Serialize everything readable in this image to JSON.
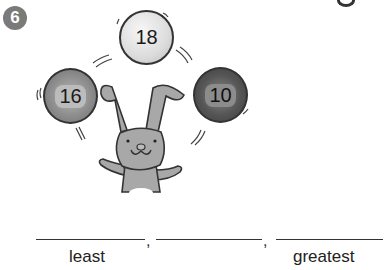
{
  "problem": {
    "number": "6",
    "balls": [
      {
        "value": "18",
        "shade": "light"
      },
      {
        "value": "16",
        "shade": "medium"
      },
      {
        "value": "10",
        "shade": "dark"
      }
    ],
    "answer_blanks": [
      {
        "label": "least",
        "value": ""
      },
      {
        "label": "",
        "value": ""
      },
      {
        "label": "greatest",
        "value": ""
      }
    ],
    "separator": ","
  },
  "colors": {
    "badge": "#7a7a7a",
    "ball_light": "#dcdcdc",
    "ball_medium": "#8d8d8d",
    "ball_dark": "#555555",
    "bunny": "#a8a8a8",
    "outline": "#333333"
  }
}
